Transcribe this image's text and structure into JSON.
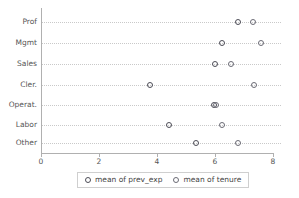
{
  "chart_data": {
    "type": "scatter",
    "title": "",
    "subtitle": "",
    "xlabel": "",
    "ylabel": "",
    "orientation": "horizontal",
    "categories": [
      "Prof",
      "Mgmt",
      "Sales",
      "Cler.",
      "Operat.",
      "Labor",
      "Other"
    ],
    "xlim": [
      0,
      8
    ],
    "xticks": [
      0,
      2,
      4,
      6,
      8
    ],
    "xtick_labels": [
      "0",
      "2",
      "4",
      "6",
      "8"
    ],
    "grid": true,
    "grid_axis": "y",
    "legend_position": "bottom",
    "series": [
      {
        "name": "mean of prev_exp",
        "color": "#4d4d57",
        "marker": "open-circle",
        "values": [
          6.8,
          6.25,
          6.0,
          3.75,
          5.95,
          4.4,
          5.35
        ]
      },
      {
        "name": "mean of tenure",
        "color": "#6b6b75",
        "marker": "open-circle",
        "values": [
          7.3,
          7.6,
          6.55,
          7.35,
          6.05,
          6.25,
          6.8
        ]
      }
    ]
  },
  "legend": {
    "entries": [
      {
        "label": "mean of prev_exp"
      },
      {
        "label": "mean of tenure"
      }
    ]
  },
  "colors": {
    "series_0": "#4d4d57",
    "series_1": "#6b6b75",
    "axis": "#b0b0b0",
    "grid": "#c9c9c9",
    "text": "#555555",
    "background": "#ffffff"
  }
}
